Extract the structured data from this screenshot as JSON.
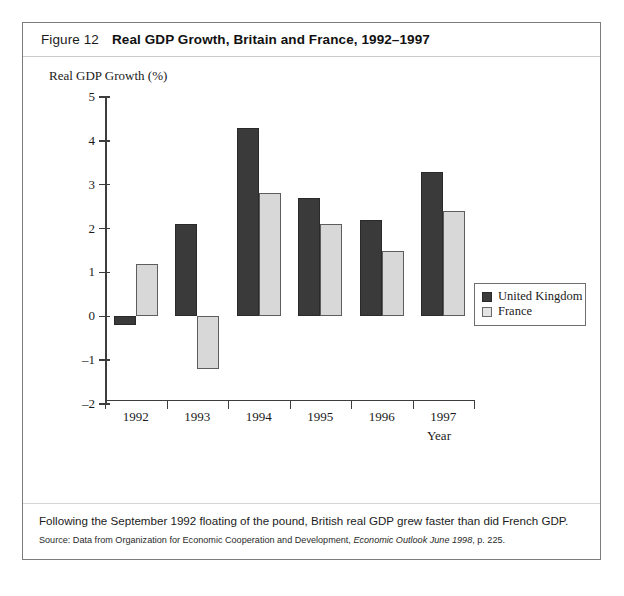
{
  "figure": {
    "number_label": "Figure 12",
    "title": "Real GDP Growth, Britain and France, 1992–1997",
    "caption": "Following the September 1992 floating of the pound, British real GDP grew faster than did French GDP.",
    "source_prefix": "Source: Data from Organization for Economic Cooperation and Development, ",
    "source_italic": "Economic Outlook June 1998",
    "source_suffix": ", p. 225."
  },
  "legend": {
    "position": "right",
    "items": [
      {
        "label": "United Kingdom",
        "color": "#3a3a3a",
        "name": "legend-uk"
      },
      {
        "label": "France",
        "color": "#e4e4e4",
        "name": "legend-france"
      }
    ]
  },
  "chart_data": {
    "type": "bar",
    "title": "Real GDP Growth, Britain and France, 1992–1997",
    "xlabel": "Year",
    "ylabel": "Real GDP Growth (%)",
    "categories": [
      "1992",
      "1993",
      "1994",
      "1995",
      "1996",
      "1997"
    ],
    "series": [
      {
        "name": "United Kingdom",
        "color": "#3a3a3a",
        "values": [
          -0.2,
          2.1,
          4.3,
          2.7,
          2.2,
          3.3
        ]
      },
      {
        "name": "France",
        "color": "#d8d8d8",
        "values": [
          1.2,
          -1.2,
          2.8,
          2.1,
          1.5,
          2.4
        ]
      }
    ],
    "ylim": [
      -2,
      5
    ],
    "yticks": [
      5,
      4,
      3,
      2,
      1,
      0,
      -1,
      -2
    ],
    "ytick_labels": [
      "5",
      "4",
      "3",
      "2",
      "1",
      "0",
      "–1",
      "–2"
    ],
    "grid": false,
    "legend_position": "right"
  }
}
